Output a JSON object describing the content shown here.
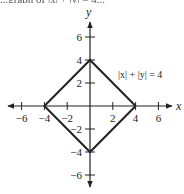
{
  "chart_data": {
    "type": "line",
    "title": "",
    "equation_label": "|x| + |y| = 4",
    "xlabel": "x",
    "ylabel": "y",
    "xlim": [
      -7,
      7
    ],
    "ylim": [
      -7,
      7
    ],
    "grid": false,
    "x_ticks": [
      -6,
      -4,
      -2,
      2,
      4,
      6
    ],
    "y_ticks": [
      6,
      4,
      2,
      -2,
      -4,
      -6
    ],
    "x_tick_labels": [
      "−6",
      "−4",
      "−2",
      "2",
      "4",
      "6"
    ],
    "y_tick_labels": [
      "6",
      "4",
      "2",
      "−2",
      "−4",
      "−6"
    ],
    "series": [
      {
        "name": "|x| + |y| = 4",
        "points": [
          [
            4,
            0
          ],
          [
            0,
            4
          ],
          [
            -4,
            0
          ],
          [
            0,
            -4
          ],
          [
            4,
            0
          ]
        ],
        "color": "#222222"
      }
    ],
    "annotations": [
      {
        "text": "|x| + |y| = 4",
        "x": 3.5,
        "y": 2.7
      }
    ]
  },
  "cropped_header_text": "...graph of |x| + |y| = 4..."
}
